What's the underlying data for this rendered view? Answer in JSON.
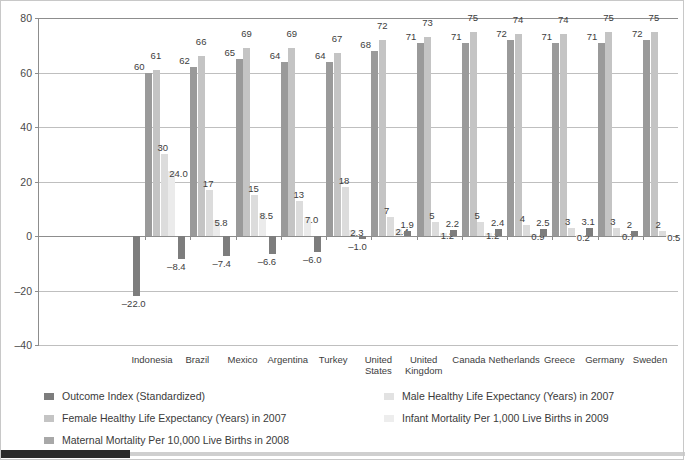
{
  "chart_data": {
    "type": "bar",
    "title": "",
    "xlabel": "",
    "ylabel": "",
    "ylim": [
      -40,
      80
    ],
    "yticks": [
      80,
      60,
      40,
      20,
      0,
      -20,
      -40
    ],
    "ytick_labels": [
      "80",
      "60",
      "40",
      "20",
      "0",
      "–20",
      "–40"
    ],
    "grid": true,
    "legend_position": "bottom",
    "categories": [
      "Indonesia",
      "Brazil",
      "Mexico",
      "Argentina",
      "Turkey",
      "United\nStates",
      "United\nKingdom",
      "Canada",
      "Netherlands",
      "Greece",
      "Germany",
      "Sweden"
    ],
    "series": [
      {
        "name": "Outcome Index (Standardized)",
        "color": "#7d7d7d",
        "values": [
          -22.0,
          -8.4,
          -7.4,
          -6.6,
          -6.0,
          -1.0,
          1.9,
          2.2,
          2.4,
          2.5,
          3.1,
          2.0
        ],
        "labels": [
          "–22.0",
          "–8.4",
          "–7.4",
          "–6.6",
          "–6.0",
          "–1.0",
          "1.9",
          "2.2",
          "2.4",
          "2.5",
          "3.1",
          "2"
        ]
      },
      {
        "name": "Male Healthy Life Expectancy (Years) in 2007",
        "color": "#9a9a9a",
        "values": [
          60,
          62,
          65,
          64,
          64,
          68,
          71,
          71,
          72,
          71,
          71,
          72
        ],
        "labels": [
          "60",
          "62",
          "65",
          "64",
          "64",
          "68",
          "71",
          "71",
          "72",
          "71",
          "71",
          "72"
        ]
      },
      {
        "name": "Female Healthy Life Expectancy (Years) in 2007",
        "color": "#c4c4c4",
        "values": [
          61,
          66,
          69,
          69,
          67,
          72,
          73,
          75,
          74,
          74,
          75,
          75
        ],
        "labels": [
          "61",
          "66",
          "69",
          "69",
          "67",
          "72",
          "73",
          "75",
          "74",
          "74",
          "75",
          "75"
        ]
      },
      {
        "name": "Infant Mortality Per 1,000 Live Births in 2009",
        "color": "#dcdcdc",
        "values": [
          30,
          17,
          15,
          13,
          18,
          7,
          5,
          5,
          4,
          3,
          3,
          2
        ],
        "labels": [
          "30",
          "17",
          "15",
          "13",
          "18",
          "7",
          "5",
          "5",
          "4",
          "3",
          "3",
          "2"
        ]
      },
      {
        "name": "Maternal Mortality Per 10,000 Live Births in 2008",
        "color": "#ebebeb",
        "values": [
          24.0,
          5.8,
          8.5,
          7.0,
          2.3,
          2.4,
          1.2,
          1.2,
          0.9,
          0.2,
          0.7,
          0.5
        ],
        "labels": [
          "24.0",
          "5.8",
          "8.5",
          "7.0",
          "2.3",
          "2.4",
          "1.2",
          "1.2",
          "0.9",
          "0.2",
          "0.7",
          "0.5"
        ]
      }
    ],
    "extra_value_labels": {
      "note": "1.2 shown for United States infant-mortality-adjacent small bar",
      "united_states_small": "1.2"
    }
  },
  "legend": {
    "left_column": [
      {
        "label": "Outcome Index (Standardized)",
        "color": "#7d7d7d"
      },
      {
        "label": "Female Healthy Life Expectancy (Years) in 2007",
        "color": "#c4c4c4"
      },
      {
        "label": "Maternal Mortality Per 10,000 Live Births in 2008",
        "color": "#a8a8a8"
      }
    ],
    "right_column": [
      {
        "label": "Male Healthy Life Expectancy (Years) in 2007",
        "color": "#e2e2e2"
      },
      {
        "label": "Infant Mortality Per 1,000 Live Births in 2009",
        "color": "#ededed"
      }
    ]
  },
  "colors": {
    "grid": "#bfbfbf",
    "axis": "#8d8d8d",
    "text": "#3a3a3a",
    "footer_tab": "#2b2b2b",
    "footer_rule": "#cfcfcf"
  }
}
